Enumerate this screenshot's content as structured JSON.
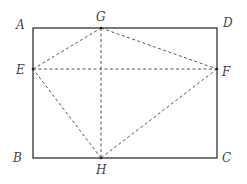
{
  "diagram": {
    "type": "geometry",
    "colors": {
      "solid_line": "#222222",
      "dashed_line": "#555555",
      "label": "#444444",
      "background": "#ffffff"
    },
    "points": {
      "A": {
        "label": "A",
        "x": 33,
        "y": 28
      },
      "B": {
        "label": "B",
        "x": 33,
        "y": 158
      },
      "C": {
        "label": "C",
        "x": 217,
        "y": 158
      },
      "D": {
        "label": "D",
        "x": 217,
        "y": 28
      },
      "E": {
        "label": "E",
        "x": 33,
        "y": 69
      },
      "F": {
        "label": "F",
        "x": 217,
        "y": 69
      },
      "G": {
        "label": "G",
        "x": 101,
        "y": 28
      },
      "H": {
        "label": "H",
        "x": 101,
        "y": 158
      }
    },
    "solid_segments": [
      "AD",
      "DC",
      "CB",
      "BA"
    ],
    "dashed_segments": [
      "EG",
      "GF",
      "FH",
      "HE",
      "EF",
      "GH"
    ]
  }
}
